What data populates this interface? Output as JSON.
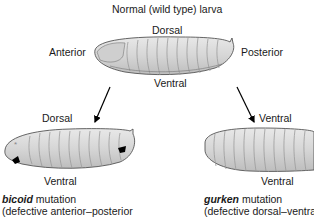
{
  "title": "Normal (wild type) larva",
  "normal": {
    "dorsal": "Dorsal",
    "ventral": "Ventral",
    "anterior": "Anterior",
    "posterior": "Posterior"
  },
  "bicoid": {
    "top_label": "Dorsal",
    "bottom_label": "Ventral",
    "gene": "bicoid",
    "caption_rest": " mutation",
    "caption_line2": "(defective anterior–posterior"
  },
  "gurken": {
    "top_label": "Ventral",
    "bottom_label": "Ventral",
    "gene": "gurken",
    "caption_rest": " mutation",
    "caption_line2": "(defective dorsal–ventral"
  },
  "colors": {
    "body_fill": "#d9d9d9",
    "segment_fill": "#ececec",
    "outline": "#555555",
    "text": "#1a1a1a",
    "marker": "#000000"
  }
}
